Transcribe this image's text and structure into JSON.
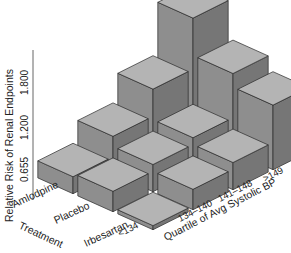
{
  "chart_data": {
    "type": "bar3d",
    "title": "",
    "zlabel": "Relative Risk of Renal Endpoints",
    "xlabel": "Quartile of Avg Systolic BP",
    "ylabel": "Treatment",
    "z_ticks": [
      "0.655",
      "1.200",
      "1.800"
    ],
    "z_tick_values": [
      0.655,
      1.2,
      1.8
    ],
    "categories": [
      "<134",
      "134–140",
      "141–148",
      ">149"
    ],
    "treatments": [
      "Amlodpine",
      "Placebo",
      "Irbesartan"
    ],
    "series": [
      {
        "name": "Amlodpine",
        "values": [
          0.85,
          1.15,
          1.55,
          2.3
        ]
      },
      {
        "name": "Placebo",
        "values": [
          0.9,
          1.0,
          1.1,
          1.75
        ]
      },
      {
        "name": "Irbesartan",
        "values": [
          0.66,
          0.9,
          1.0,
          1.55
        ]
      }
    ],
    "grid": false,
    "legend": "none"
  },
  "colors": {
    "top": "#b4b4b4",
    "left": "#8e8e8e",
    "right": "#767676",
    "edge": "#2a2a2a",
    "axis": "#555555"
  }
}
